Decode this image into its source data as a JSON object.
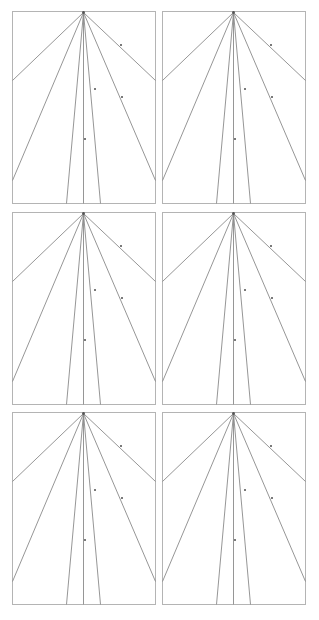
{
  "colors": {
    "background": "#ffffff",
    "border": "#b4b4b4",
    "line": "#8a8a8a",
    "apex": "#555555",
    "label": "#7a7a7a"
  },
  "diagram": {
    "title": "",
    "panel_width": 143,
    "panel_height": 192,
    "apex": [
      71,
      1
    ],
    "rays": [
      {
        "id": "upper-left",
        "to": [
          0,
          69
        ]
      },
      {
        "id": "lower-left",
        "to": [
          0,
          169
        ]
      },
      {
        "id": "inner-left",
        "to": [
          54,
          192
        ]
      },
      {
        "id": "center",
        "to": [
          71,
          192
        ]
      },
      {
        "id": "inner-right",
        "to": [
          88,
          192
        ]
      },
      {
        "id": "lower-right",
        "to": [
          143,
          169
        ]
      },
      {
        "id": "upper-right",
        "to": [
          143,
          69
        ]
      }
    ],
    "markers": [
      {
        "on": "upper-right",
        "at": [
          108,
          33
        ]
      },
      {
        "on": "inner-right",
        "at": [
          82,
          77
        ]
      },
      {
        "on": "lower-right",
        "at": [
          109,
          85
        ]
      },
      {
        "on": "center",
        "at": [
          72,
          127
        ]
      }
    ],
    "panels": [
      {
        "id": "panel-1",
        "x": 12,
        "y": 11
      },
      {
        "id": "panel-2",
        "x": 162,
        "y": 11
      },
      {
        "id": "panel-3",
        "x": 12,
        "y": 212
      },
      {
        "id": "panel-4",
        "x": 162,
        "y": 212
      },
      {
        "id": "panel-5",
        "x": 12,
        "y": 412
      },
      {
        "id": "panel-6",
        "x": 162,
        "y": 412
      }
    ]
  }
}
